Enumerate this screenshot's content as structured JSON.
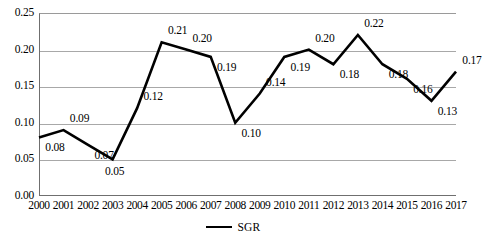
{
  "chart_data": {
    "type": "line",
    "title": "",
    "subtitle": "",
    "xlabel": "",
    "ylabel": "",
    "categories": [
      "2000",
      "2001",
      "2002",
      "2003",
      "2004",
      "2005",
      "2006",
      "2007",
      "2008",
      "2009",
      "2010",
      "2011",
      "2012",
      "2013",
      "2014",
      "2015",
      "2016",
      "2017"
    ],
    "series": [
      {
        "name": "SGR",
        "color": "#000000",
        "values": [
          0.08,
          0.09,
          0.07,
          0.05,
          0.12,
          0.21,
          0.2,
          0.19,
          0.1,
          0.14,
          0.19,
          0.2,
          0.18,
          0.22,
          0.18,
          0.16,
          0.13,
          0.17
        ]
      }
    ],
    "point_labels": [
      "0.08",
      "0.09",
      "0.07",
      "0.05",
      "0.12",
      "0.21",
      "0.20",
      "0.19",
      "0.10",
      "0.14",
      "0.19",
      "0.20",
      "0.18",
      "0.22",
      "0.18",
      "0.16",
      "0.13",
      "0.17"
    ],
    "label_positions": [
      "below-right",
      "above-right",
      "below-right",
      "below",
      "above-right",
      "above-right",
      "above-right",
      "below-right",
      "below-right",
      "above-right",
      "below-right",
      "above-right",
      "below-right",
      "above-right",
      "below-right",
      "below-right",
      "below-right",
      "above-right"
    ],
    "ylim": [
      0.0,
      0.25
    ],
    "ytick_step": 0.05,
    "ytick_labels": [
      "0.00",
      "0.05",
      "0.10",
      "0.15",
      "0.20",
      "0.25"
    ],
    "ytick_values": [
      0.0,
      0.05,
      0.1,
      0.15,
      0.2,
      0.25
    ],
    "grid": "horizontal",
    "grid_color": "#a8a8a8",
    "axis_color": "#6f6f6f",
    "legend": {
      "position": "bottom-center",
      "entries": [
        {
          "label": "SGR",
          "color": "#000000",
          "marker": "line"
        }
      ]
    },
    "plot_background": "#ffffff"
  }
}
